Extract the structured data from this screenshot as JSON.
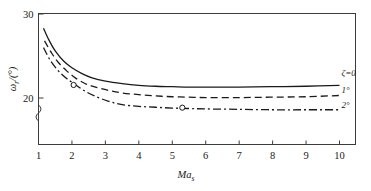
{
  "chart_data": {
    "type": "line",
    "title": "",
    "xlabel": "Mas",
    "xlabel_main": "Ma",
    "xlabel_sub": "s",
    "ylabel": "ωr/(°)",
    "ylabel_main": "ω",
    "ylabel_sub": "r",
    "ylabel_unit": "/(°)",
    "xlim": [
      1,
      10
    ],
    "ylim": [
      20,
      30
    ],
    "y_axis_break": true,
    "grid": false,
    "legend_position": "right-inline",
    "xticks": [
      1,
      2,
      3,
      4,
      5,
      6,
      7,
      8,
      9,
      10
    ],
    "xtick_labels": [
      "1",
      "2",
      "3",
      "4",
      "5",
      "6",
      "7",
      "8",
      "9",
      "10"
    ],
    "yticks": [
      20,
      30
    ],
    "ytick_labels": [
      "20",
      "30"
    ],
    "series": [
      {
        "name": "ζ=0",
        "label": "ζ=0",
        "style": "solid",
        "color": "#1a1a1a",
        "x": [
          1.15,
          1.3,
          1.5,
          1.75,
          2.0,
          2.3,
          2.6,
          3.0,
          3.5,
          4.0,
          4.5,
          5.0,
          5.5,
          6.0,
          7.0,
          8.0,
          9.0,
          10.0
        ],
        "y": [
          28.3,
          27.0,
          25.6,
          24.4,
          23.6,
          22.9,
          22.4,
          22.0,
          21.7,
          21.5,
          21.4,
          21.35,
          21.3,
          21.3,
          21.3,
          21.35,
          21.4,
          21.5
        ]
      },
      {
        "name": "1°",
        "label": "1°",
        "style": "dashed",
        "color": "#1a1a1a",
        "x": [
          1.18,
          1.4,
          1.6,
          1.85,
          2.1,
          2.4,
          2.7,
          3.1,
          3.5,
          4.0,
          4.5,
          5.0,
          5.5,
          6.0,
          7.0,
          8.0,
          9.0,
          10.0
        ],
        "y": [
          26.8,
          25.3,
          24.2,
          23.2,
          22.4,
          21.7,
          21.3,
          20.9,
          20.6,
          20.4,
          20.25,
          20.15,
          20.1,
          20.05,
          20.05,
          20.1,
          20.15,
          20.3
        ]
      },
      {
        "name": "2°",
        "label": "2°",
        "style": "dashdot",
        "color": "#1a1a1a",
        "x": [
          1.15,
          1.35,
          1.6,
          1.85,
          2.1,
          2.4,
          2.7,
          3.1,
          3.5,
          4.0,
          4.5,
          5.0,
          5.5,
          6.0,
          7.0,
          8.0,
          9.0,
          10.0
        ],
        "y": [
          26.0,
          24.5,
          23.2,
          22.3,
          21.6,
          20.8,
          20.2,
          19.6,
          19.2,
          19.0,
          18.9,
          18.8,
          18.75,
          18.7,
          18.65,
          18.6,
          18.6,
          18.6
        ]
      }
    ],
    "markers": [
      {
        "x": 2.05,
        "y": 21.55,
        "shape": "circle-open",
        "series": "1°"
      },
      {
        "x": 5.3,
        "y": 18.85,
        "shape": "circle-open",
        "series": "2°"
      }
    ]
  }
}
